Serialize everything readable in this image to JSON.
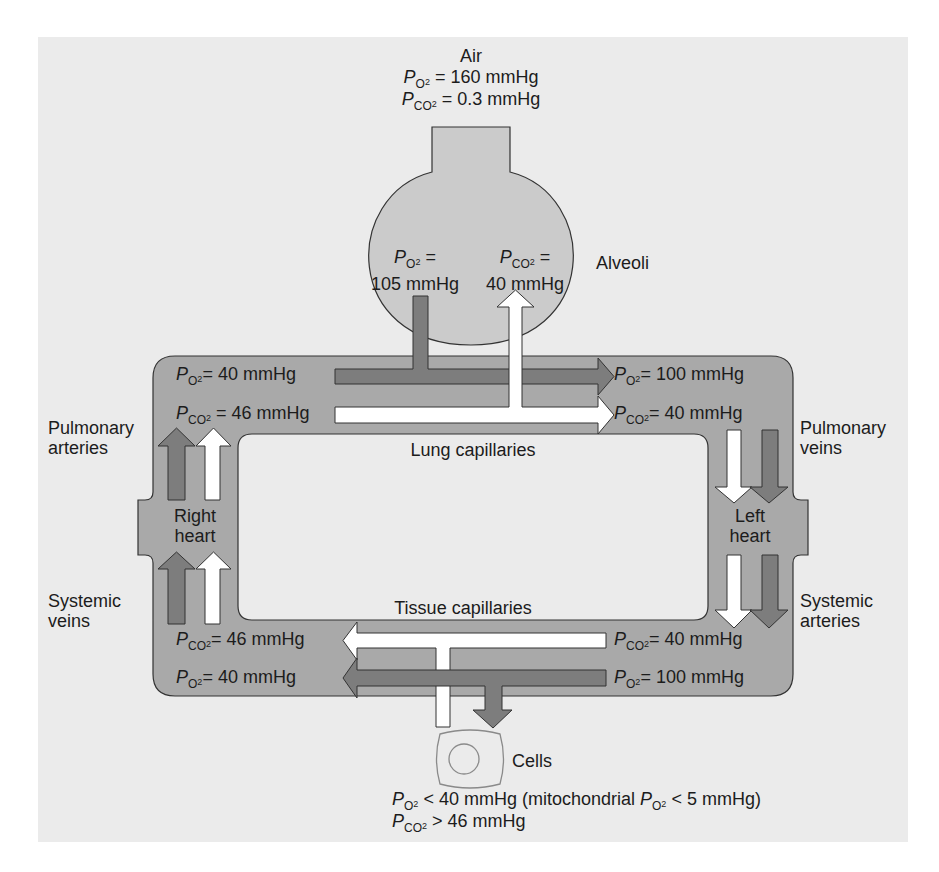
{
  "figure": {
    "colors": {
      "panel_background": "#ebebeb",
      "vessel_fill": "#a9a9a9",
      "heart_fill": "#a9a9a9",
      "alveolus_fill": "#cbcbcb",
      "o2_arrow": "#7d7d7d",
      "co2_arrow": "#ffffff",
      "outline": "#333333",
      "cell_outline": "#8a8a8a"
    },
    "air": {
      "title": "Air",
      "po2": {
        "symbol": "P",
        "sub": "O",
        "sub2": "2",
        "value": "= 160 mmHg"
      },
      "pco2": {
        "symbol": "P",
        "sub": "CO",
        "sub2": "2",
        "value": "= 0.3 mmHg"
      }
    },
    "alveoli": {
      "label": "Alveoli",
      "po2": {
        "symbol": "P",
        "sub": "O",
        "sub2": "2",
        "eq": "=",
        "value": "105 mmHg"
      },
      "pco2": {
        "symbol": "P",
        "sub": "CO",
        "sub2": "2",
        "eq": "=",
        "value": "40 mmHg"
      }
    },
    "lung_capillaries": {
      "label": "Lung capillaries",
      "in_po2": {
        "symbol": "P",
        "sub": "O",
        "sub2": "2",
        "value": "= 40 mmHg"
      },
      "in_pco2": {
        "symbol": "P",
        "sub": "CO",
        "sub2": "2",
        "value": "= 46 mmHg"
      },
      "out_po2": {
        "symbol": "P",
        "sub": "O",
        "sub2": "2",
        "value": "= 100 mmHg"
      },
      "out_pco2": {
        "symbol": "P",
        "sub": "CO",
        "sub2": "2",
        "value": "= 40 mmHg"
      }
    },
    "tissue_capillaries": {
      "label": "Tissue capillaries",
      "in_pco2": {
        "symbol": "P",
        "sub": "CO",
        "sub2": "2",
        "value": "= 40 mmHg"
      },
      "in_po2": {
        "symbol": "P",
        "sub": "O",
        "sub2": "2",
        "value": "= 100 mmHg"
      },
      "out_pco2": {
        "symbol": "P",
        "sub": "CO",
        "sub2": "2",
        "value": "= 46 mmHg"
      },
      "out_po2": {
        "symbol": "P",
        "sub": "O",
        "sub2": "2",
        "value": "= 40 mmHg"
      }
    },
    "vessels": {
      "pulmonary_arteries": [
        "Pulmonary",
        "arteries"
      ],
      "pulmonary_veins": [
        "Pulmonary",
        "veins"
      ],
      "systemic_veins": [
        "Systemic",
        "veins"
      ],
      "systemic_arteries": [
        "Systemic",
        "arteries"
      ]
    },
    "hearts": {
      "right": [
        "Right",
        "heart"
      ],
      "left": [
        "Left",
        "heart"
      ]
    },
    "cells": {
      "label": "Cells",
      "po2": {
        "symbol": "P",
        "sub": "O",
        "sub2": "2",
        "value": "< 40 mmHg (mitochondrial ",
        "mito_symbol": "P",
        "mito_sub": "O",
        "mito_sub2": "2",
        "mito_value": "< 5 mmHg)"
      },
      "pco2": {
        "symbol": "P",
        "sub": "CO",
        "sub2": "2",
        "value": "> 46 mmHg"
      }
    }
  }
}
